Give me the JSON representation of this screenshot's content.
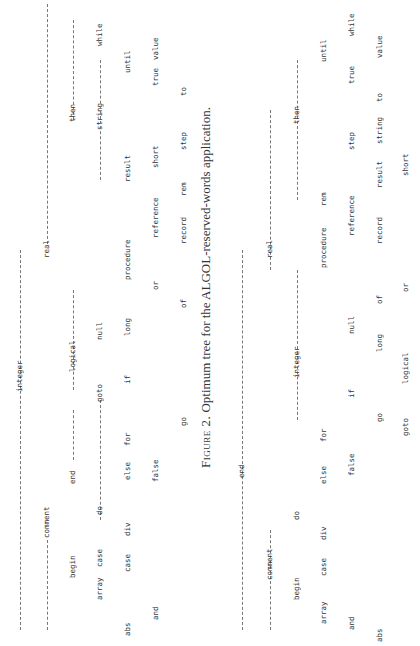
{
  "caption": {
    "figure_label": "Figure 2.",
    "text": "Optimum tree for the ALGOL-reserved-words application."
  },
  "tree1": {
    "root": "integer",
    "nodes": {
      "integer": "integer",
      "comment": "comment",
      "real": "real",
      "begin": "begin",
      "end": "end",
      "logical": "logical",
      "then": "then",
      "array": "array",
      "case": "case",
      "do": "do",
      "goto": "goto",
      "null": "null",
      "procedure": "procedure",
      "string": "string",
      "while": "while",
      "abs": "abs",
      "and": "and",
      "div": "div",
      "else": "else",
      "for": "for",
      "if": "if",
      "long": "long",
      "or": "or",
      "result": "result",
      "until": "until",
      "false": "false",
      "go": "go",
      "of": "of",
      "reference": "reference",
      "short": "short",
      "true": "true",
      "value": "value",
      "record": "record",
      "rem": "rem",
      "step": "step",
      "to": "to"
    }
  },
  "tree2": {
    "root": "end",
    "nodes": {
      "end": "end",
      "comment": "comment",
      "real": "real",
      "begin": "begin",
      "do": "do",
      "integer": "integer",
      "then": "then",
      "array": "array",
      "case": "case",
      "div": "div",
      "else": "else",
      "for": "for",
      "procedure": "procedure",
      "rem": "rem",
      "until": "until",
      "and": "and",
      "false": "false",
      "if": "if",
      "null": "null",
      "reference": "reference",
      "step": "step",
      "true": "true",
      "while": "while",
      "abs": "abs",
      "go": "go",
      "long": "long",
      "of": "of",
      "record": "record",
      "result": "result",
      "string": "string",
      "to": "to",
      "value": "value",
      "goto": "goto",
      "logical": "logical",
      "or": "or",
      "short": "short"
    }
  }
}
